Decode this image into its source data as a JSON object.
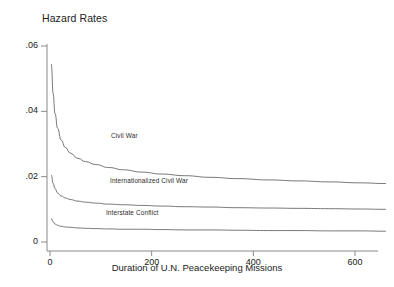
{
  "chart_data": {
    "type": "line",
    "title": "Hazard Rates",
    "xlabel": "Duration of U.N. Peacekeeping Missions",
    "ylabel": "",
    "xlim": [
      -8,
      680
    ],
    "ylim": [
      0,
      0.064
    ],
    "grid": false,
    "legend_position": "inline-annotations",
    "xticks": [
      0,
      200,
      400,
      600
    ],
    "xtick_labels": [
      "0",
      "200",
      "400",
      "600"
    ],
    "yticks": [
      0,
      0.02,
      0.04,
      0.06
    ],
    "ytick_labels": [
      "0",
      ".02",
      ".04",
      ".06"
    ],
    "line_color": "#555555",
    "axis_color": "#8a8a8a",
    "series": [
      {
        "name": "Civil War",
        "label_x": 120,
        "label_y": 0.0325,
        "x": [
          3,
          6,
          10,
          15,
          22,
          30,
          40,
          55,
          70,
          90,
          115,
          145,
          180,
          220,
          265,
          315,
          370,
          430,
          490,
          550,
          610,
          660
        ],
        "values": [
          0.0545,
          0.0455,
          0.0392,
          0.0348,
          0.0312,
          0.029,
          0.0272,
          0.0256,
          0.0246,
          0.0237,
          0.0228,
          0.0221,
          0.0214,
          0.0208,
          0.0203,
          0.0198,
          0.0194,
          0.019,
          0.0187,
          0.0184,
          0.0181,
          0.0179
        ]
      },
      {
        "name": "Internationalized Civil War",
        "label_x": 118,
        "label_y": 0.0187,
        "x": [
          3,
          6,
          10,
          15,
          22,
          30,
          40,
          55,
          70,
          90,
          115,
          145,
          180,
          220,
          265,
          315,
          370,
          430,
          490,
          550,
          610,
          660
        ],
        "values": [
          0.0205,
          0.018,
          0.0163,
          0.015,
          0.0141,
          0.0135,
          0.013,
          0.0125,
          0.0122,
          0.0119,
          0.0116,
          0.0114,
          0.0112,
          0.011,
          0.0108,
          0.0107,
          0.0105,
          0.0104,
          0.0103,
          0.0102,
          0.0101,
          0.01
        ]
      },
      {
        "name": "Interstate Conflict",
        "label_x": 110,
        "label_y": 0.0088,
        "x": [
          3,
          6,
          10,
          15,
          22,
          30,
          40,
          55,
          70,
          90,
          115,
          145,
          180,
          220,
          265,
          315,
          370,
          430,
          490,
          550,
          610,
          660
        ],
        "values": [
          0.0072,
          0.0062,
          0.0055,
          0.0051,
          0.0048,
          0.0046,
          0.0045,
          0.0043,
          0.0042,
          0.0041,
          0.004,
          0.0039,
          0.0039,
          0.0038,
          0.0037,
          0.0037,
          0.0036,
          0.0035,
          0.0035,
          0.0034,
          0.0034,
          0.0033
        ]
      }
    ]
  }
}
